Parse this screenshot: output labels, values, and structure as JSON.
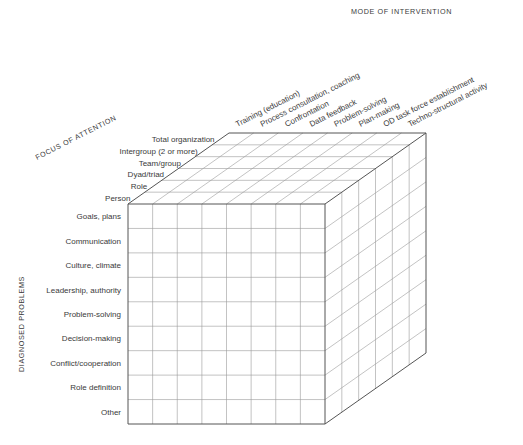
{
  "axes": {
    "mode_of_intervention": {
      "title": "MODE OF INTERVENTION",
      "items": [
        "Training (education)",
        "Process consultation, coaching",
        "Confrontation",
        "Data feedback",
        "Problem-solving",
        "Plan-making",
        "OD task force establishment",
        "Techno-structural activity"
      ]
    },
    "focus_of_attention": {
      "title": "FOCUS OF ATTENTION",
      "items": [
        "Total organization",
        "Intergroup (2 or more)",
        "Team/group",
        "Dyad/triad",
        "Role",
        "Person"
      ]
    },
    "diagnosed_problems": {
      "title": "DIAGNOSED PROBLEMS",
      "items": [
        "Goals, plans",
        "Communication",
        "Culture, climate",
        "Leadership, authority",
        "Problem-solving",
        "Decision-making",
        "Conflict/cooperation",
        "Role definition",
        "Other"
      ]
    }
  },
  "colors": {
    "edge": "#555555",
    "grid": "#9a9a9a",
    "text": "#3a3a3a",
    "background": "#ffffff"
  }
}
